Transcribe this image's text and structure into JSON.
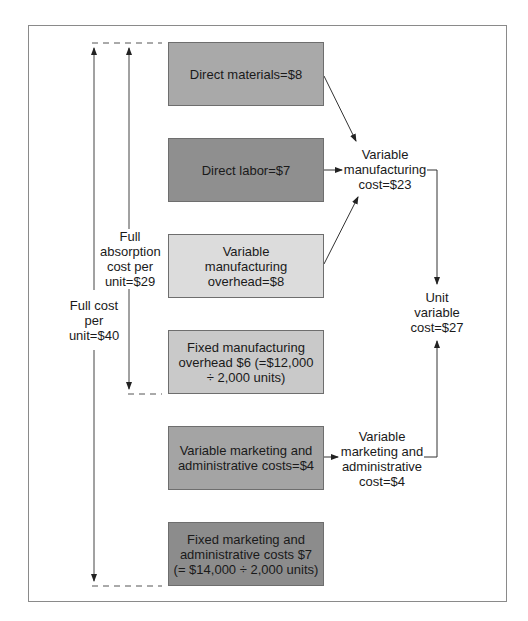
{
  "diagram": {
    "cost_boxes": [
      {
        "id": "direct-materials",
        "label": "Direct materials=$8",
        "color": "#a9a9a9"
      },
      {
        "id": "direct-labor",
        "label": "Direct labor=$7",
        "color": "#8f8f8f"
      },
      {
        "id": "variable-mfg-overhead",
        "label": "Variable manufacturing overhead=$8",
        "color": "#dcdcdc"
      },
      {
        "id": "fixed-mfg-overhead",
        "label": "Fixed manufacturing overhead $6 (=$12,000 ÷ 2,000 units)",
        "color": "#c9c9c9"
      },
      {
        "id": "variable-mkt-admin",
        "label": "Variable marketing and administrative costs=$4",
        "color": "#a4a4a4"
      },
      {
        "id": "fixed-mkt-admin",
        "label": "Fixed marketing and administrative costs $7 (= $14,000 ÷ 2,000 units)",
        "color": "#8c8c8c"
      }
    ],
    "labels": {
      "variable_mfg_cost": "Variable manufacturing cost=$23",
      "unit_variable_cost": "Unit variable cost=$27",
      "variable_mkt_admin_cost": "Variable marketing and administrative cost=$4",
      "full_absorption_cost": "Full absorption cost per unit=$29",
      "full_cost": "Full cost per unit=$40"
    }
  }
}
